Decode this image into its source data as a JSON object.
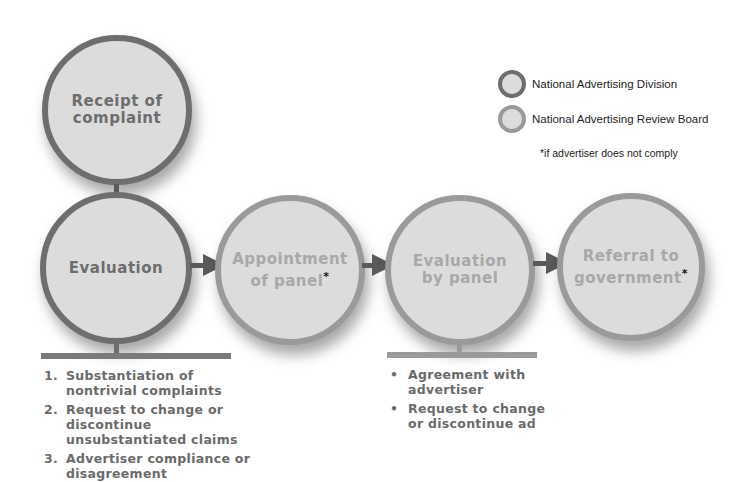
{
  "legend": {
    "items": [
      {
        "label": "National Advertising Division",
        "ring_color": "#6e6e6e"
      },
      {
        "label": "National Advertising Review Board",
        "ring_color": "#9a9a9a"
      }
    ],
    "footnote": "*if advertiser does not comply"
  },
  "nodes": {
    "receipt": {
      "line1": "Receipt of",
      "line2": "complaint",
      "group": "National Advertising Division"
    },
    "evaluation": {
      "line1": "Evaluation",
      "group": "National Advertising Division"
    },
    "appointment": {
      "line1": "Appointment",
      "line2": "of panel",
      "star": "*",
      "group": "National Advertising Review Board"
    },
    "evaluation_panel": {
      "line1": "Evaluation",
      "line2": "by panel",
      "group": "National Advertising Review Board"
    },
    "referral": {
      "line1": "Referral to",
      "line2": "government",
      "star": "*",
      "group": "National Advertising Review Board"
    }
  },
  "evaluation_steps": [
    {
      "marker": "1.",
      "text": "Substantiation of nontrivial complaints"
    },
    {
      "marker": "2.",
      "text": "Request to change or discontinue unsubstantiated claims"
    },
    {
      "marker": "3.",
      "text": "Advertiser compliance or disagreement"
    }
  ],
  "panel_outcomes": [
    {
      "marker": "•",
      "text": "Agreement with advertiser"
    },
    {
      "marker": "•",
      "text": "Request to change or discontinue ad"
    }
  ],
  "colors": {
    "circle_fill": "#dcdcdc",
    "nad_ring": "#6e6e6e",
    "narb_ring": "#9a9a9a",
    "arrow": "#5a5a5a"
  }
}
